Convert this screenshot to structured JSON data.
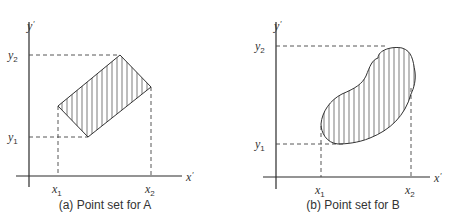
{
  "panels": [
    {
      "id": "a",
      "caption": "(a) Point set for A",
      "axis_labels": {
        "x": "x",
        "y": "y",
        "prime": "′"
      },
      "tick_labels": {
        "x1": "x",
        "x1_sub": "1",
        "x2": "x",
        "x2_sub": "2",
        "y1": "y",
        "y1_sub": "1",
        "y2": "y",
        "y2_sub": "2"
      },
      "shape": "parallelogram (hatched)"
    },
    {
      "id": "b",
      "caption": "(b) Point set for B",
      "axis_labels": {
        "x": "x",
        "y": "y",
        "prime": "′"
      },
      "tick_labels": {
        "x1": "x",
        "x1_sub": "1",
        "x2": "x",
        "x2_sub": "2",
        "y1": "y",
        "y1_sub": "1",
        "y2": "y",
        "y2_sub": "2"
      },
      "shape": "kidney-shaped blob (hatched)"
    }
  ],
  "colors": {
    "line": "#333333",
    "background": "#ffffff"
  }
}
